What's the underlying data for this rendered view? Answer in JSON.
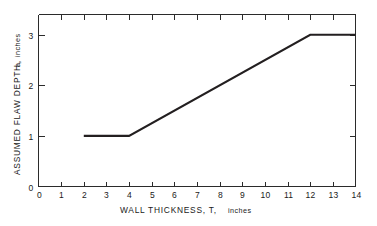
{
  "chart_data": {
    "type": "line",
    "title": "",
    "xlabel": "WALL THICKNESS, T, inches",
    "ylabel": "ASSUMED FLAW DEPTH, a, inches",
    "xlim": [
      0,
      14
    ],
    "ylim": [
      0,
      3.4
    ],
    "xticks": [
      0,
      1,
      2,
      3,
      4,
      5,
      6,
      7,
      8,
      9,
      10,
      11,
      12,
      13,
      14
    ],
    "xticklabels": [
      "0",
      "1",
      "2",
      "3",
      "4",
      "5",
      "6",
      "7",
      "8",
      "9",
      "10",
      "11",
      "12",
      "13",
      "14"
    ],
    "yticks": [
      0,
      1,
      2,
      3
    ],
    "yticklabels": [
      "0",
      "1",
      "2",
      "3"
    ],
    "grid": false,
    "legend": null,
    "line_color": "#231f20",
    "axis_color": "#2b2b2b",
    "series": [
      {
        "name": "assumed flaw depth",
        "x": [
          2,
          4,
          12,
          14
        ],
        "values": [
          1,
          1,
          3,
          3
        ]
      }
    ],
    "annotations": []
  },
  "axis_titles": {
    "x_main": "WALL THICKNESS, T,",
    "x_units": "inches",
    "y_main": "ASSUMED FLAW DEPTH,",
    "y_var": "a,",
    "y_units": "inches"
  }
}
